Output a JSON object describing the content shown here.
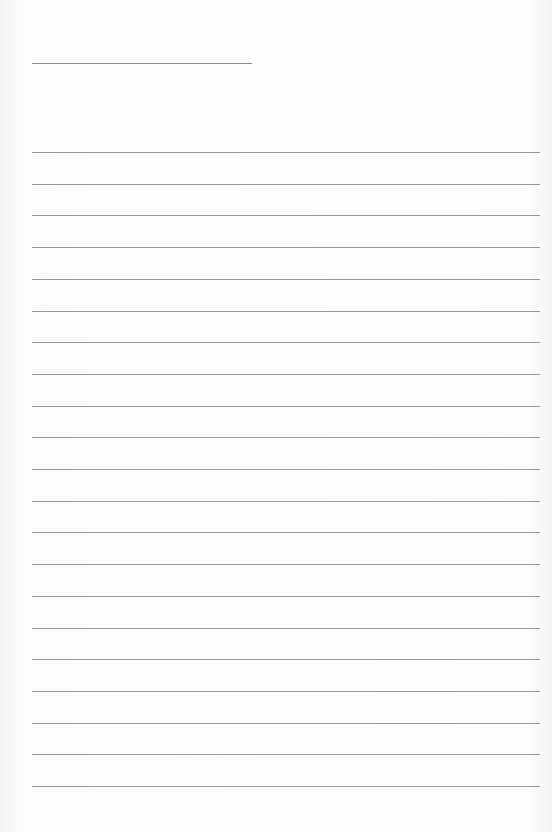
{
  "document": {
    "type": "lined-paper",
    "header_line": {
      "x": 32,
      "y": 63,
      "width": 220
    },
    "rules": {
      "count": 21,
      "start_y": 152,
      "spacing": 31.7,
      "x": 32,
      "width": 508
    },
    "colors": {
      "paper": "#fcfcfc",
      "line": "#9a9a9a"
    }
  }
}
